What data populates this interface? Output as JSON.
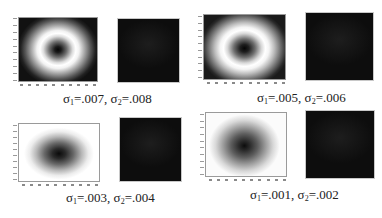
{
  "figure": {
    "panels": [
      {
        "id": "p1",
        "heatmap_style": "ring",
        "caption": {
          "sigma_symbol": "σ",
          "sub1": "1",
          "value1": "=.007, ",
          "sub2": "2",
          "value2": "=.008"
        },
        "sigma1": 0.007,
        "sigma2": 0.008
      },
      {
        "id": "p2",
        "heatmap_style": "ring",
        "caption": {
          "sigma_symbol": "σ",
          "sub1": "1",
          "value1": "=.005, ",
          "sub2": "2",
          "value2": "=.006"
        },
        "sigma1": 0.005,
        "sigma2": 0.006
      },
      {
        "id": "p3",
        "heatmap_style": "blob",
        "caption": {
          "sigma_symbol": "σ",
          "sub1": "1",
          "value1": "=.003, ",
          "sub2": "2",
          "value2": "=.004"
        },
        "sigma1": 0.003,
        "sigma2": 0.004
      },
      {
        "id": "p4",
        "heatmap_style": "blob",
        "caption": {
          "sigma_symbol": "σ",
          "sub1": "1",
          "value1": "=.001, ",
          "sub2": "2",
          "value2": "=.002"
        },
        "sigma1": 0.001,
        "sigma2": 0.002
      }
    ],
    "tick_counts": {
      "y": 10,
      "x": 10
    }
  }
}
